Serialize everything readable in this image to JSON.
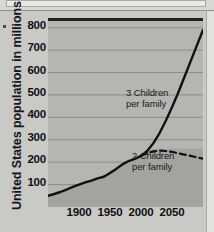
{
  "page": {
    "background_color": "#c9c9c5",
    "top_cropped_band": "",
    "left_speck": ""
  },
  "chart_data": {
    "type": "line",
    "title": "",
    "xlabel": "",
    "ylabel": "United States population in millions",
    "xlim": [
      1850,
      2100
    ],
    "ylim": [
      0,
      830
    ],
    "grid": true,
    "grid_axis": "y",
    "legend_position": "inline-annotations",
    "yticks": [
      100,
      200,
      300,
      400,
      500,
      600,
      700,
      800
    ],
    "ytick_labels": [
      "100",
      "200",
      "300",
      "400",
      "500",
      "600",
      "700",
      "800"
    ],
    "xticks": [
      1900,
      1950,
      2000,
      2050
    ],
    "xtick_labels": [
      "1900",
      "1950",
      "2000",
      "2050"
    ],
    "annotations": [
      {
        "name": "three-children-label",
        "line1": "3 Children",
        "line2": "per family"
      },
      {
        "name": "two-children-label",
        "line1": "2 Children",
        "line2": "per family"
      }
    ],
    "series": [
      {
        "name": "3 Children per family",
        "style": "solid",
        "color": "#111115",
        "x": [
          1850,
          1860,
          1870,
          1880,
          1890,
          1900,
          1910,
          1920,
          1930,
          1940,
          1950,
          1960,
          1970,
          1980,
          1990,
          2000,
          2010,
          2020,
          2030,
          2040,
          2050,
          2060,
          2070,
          2080,
          2090,
          2100
        ],
        "values": [
          50,
          58,
          67,
          78,
          90,
          100,
          110,
          118,
          128,
          135,
          152,
          170,
          190,
          205,
          215,
          228,
          250,
          285,
          330,
          385,
          445,
          510,
          580,
          650,
          720,
          790
        ]
      },
      {
        "name": "2 Children per family",
        "style": "dashed",
        "color": "#111115",
        "x": [
          2000,
          2010,
          2020,
          2030,
          2040,
          2050,
          2060,
          2070,
          2080,
          2090,
          2100
        ],
        "values": [
          228,
          240,
          248,
          252,
          250,
          246,
          240,
          234,
          228,
          222,
          216
        ]
      }
    ]
  }
}
